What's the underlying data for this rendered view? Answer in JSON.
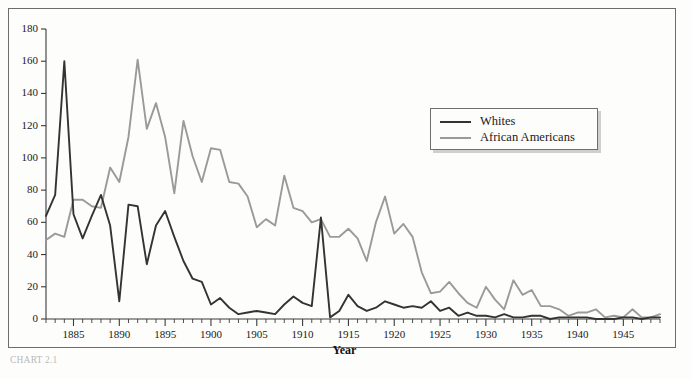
{
  "figure": {
    "caption": "CHART 2.1",
    "background_color": "#fdfdfc",
    "frame_color": "#6d6d6d"
  },
  "legend": {
    "position": "upper-right",
    "entries": [
      {
        "label": "Whites",
        "color": "#333333"
      },
      {
        "label": "African Americans",
        "color": "#9a9a9a"
      }
    ]
  },
  "chart_data": {
    "type": "line",
    "title": "",
    "subtitle": "",
    "xlabel": "Year",
    "ylabel": "",
    "xlim": [
      1882,
      1949
    ],
    "ylim": [
      0,
      180
    ],
    "ytick_step": 20,
    "yticks": [
      0,
      20,
      40,
      60,
      80,
      100,
      120,
      140,
      160,
      180
    ],
    "xticks_labeled": [
      1885,
      1890,
      1895,
      1900,
      1905,
      1910,
      1915,
      1920,
      1925,
      1930,
      1935,
      1940,
      1945
    ],
    "xtick_minor_step": 1,
    "grid": false,
    "legend_position": "upper-right",
    "x": [
      1882,
      1883,
      1884,
      1885,
      1886,
      1887,
      1888,
      1889,
      1890,
      1891,
      1892,
      1893,
      1894,
      1895,
      1896,
      1897,
      1898,
      1899,
      1900,
      1901,
      1902,
      1903,
      1904,
      1905,
      1906,
      1907,
      1908,
      1909,
      1910,
      1911,
      1912,
      1913,
      1914,
      1915,
      1916,
      1917,
      1918,
      1919,
      1920,
      1921,
      1922,
      1923,
      1924,
      1925,
      1926,
      1927,
      1928,
      1929,
      1930,
      1931,
      1932,
      1933,
      1934,
      1935,
      1936,
      1937,
      1938,
      1939,
      1940,
      1941,
      1942,
      1943,
      1944,
      1945,
      1946,
      1947,
      1948,
      1949
    ],
    "series": [
      {
        "name": "Whites",
        "color": "#333333",
        "values": [
          64,
          77,
          160,
          65,
          50,
          64,
          77,
          58,
          11,
          71,
          70,
          34,
          58,
          67,
          51,
          36,
          25,
          23,
          9,
          13,
          7,
          3,
          4,
          5,
          4,
          3,
          9,
          14,
          10,
          8,
          63,
          1,
          5,
          15,
          8,
          5,
          7,
          11,
          9,
          7,
          8,
          7,
          11,
          5,
          7,
          2,
          4,
          2,
          2,
          1,
          3,
          1,
          1,
          2,
          2,
          0,
          1,
          1,
          1,
          1,
          0,
          0,
          0,
          1,
          1,
          0,
          1,
          1
        ]
      },
      {
        "name": "African Americans",
        "color": "#9a9a9a",
        "values": [
          49,
          53,
          51,
          74,
          74,
          70,
          69,
          94,
          85,
          113,
          161,
          118,
          134,
          113,
          78,
          123,
          101,
          85,
          106,
          105,
          85,
          84,
          76,
          57,
          62,
          58,
          89,
          69,
          67,
          60,
          62,
          51,
          51,
          56,
          50,
          36,
          60,
          76,
          53,
          59,
          51,
          29,
          16,
          17,
          23,
          16,
          10,
          7,
          20,
          12,
          6,
          24,
          15,
          18,
          8,
          8,
          6,
          2,
          4,
          4,
          6,
          1,
          2,
          1,
          6,
          1,
          1,
          3
        ]
      }
    ]
  }
}
